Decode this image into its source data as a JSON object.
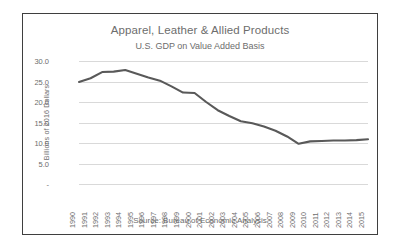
{
  "chart_data": {
    "type": "line",
    "title": "Apparel, Leather & Allied Products",
    "subtitle": "U.S. GDP on Value Added Basis",
    "xlabel": "",
    "ylabel": "Billions of 2016 Dollars",
    "source": "Source: Bureau of Economic Analysis",
    "grid": true,
    "legend": "none",
    "line_color": "#595959",
    "grid_color": "#d9d9d9",
    "text_color": "#6d6d6d",
    "border_color": "#3f3f3f",
    "ylim": [
      0,
      30
    ],
    "yticks": [
      0,
      5,
      10,
      15,
      20,
      25,
      30
    ],
    "ytick_labels": [
      "-",
      "5.0",
      "10.0",
      "15.0",
      "20.0",
      "25.0",
      "30.0"
    ],
    "categories": [
      "1990",
      "1991",
      "1992",
      "1993",
      "1994",
      "1995",
      "1996",
      "1997",
      "1998",
      "1999",
      "2000",
      "2001",
      "2002",
      "2003",
      "2004",
      "2005",
      "2006",
      "2007",
      "2008",
      "2009",
      "2010",
      "2011",
      "2012",
      "2013",
      "2014",
      "2015"
    ],
    "values": [
      24.9,
      25.8,
      27.3,
      27.4,
      27.8,
      26.9,
      26.0,
      25.2,
      23.8,
      22.3,
      22.2,
      20.0,
      18.0,
      16.6,
      15.3,
      14.8,
      14.0,
      13.0,
      11.6,
      9.8,
      10.4,
      10.5,
      10.6,
      10.6,
      10.7,
      10.9
    ]
  }
}
